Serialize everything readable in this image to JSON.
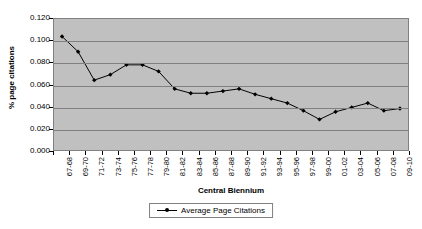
{
  "chart_data": {
    "type": "line",
    "title": "",
    "xlabel": "Central Biennium",
    "ylabel": "% page citations",
    "ylim": [
      0.0,
      0.12
    ],
    "ytick_step": 0.02,
    "grid": true,
    "legend_position": "bottom",
    "yticks": [
      "0.000",
      "0.020",
      "0.040",
      "0.060",
      "0.080",
      "0.100",
      "0.120"
    ],
    "ytick_values": [
      0.0,
      0.02,
      0.04,
      0.06,
      0.08,
      0.1,
      0.12
    ],
    "categories": [
      "67-68",
      "69-70",
      "71-72",
      "73-74",
      "75-76",
      "77-78",
      "79-80",
      "81-82",
      "83-84",
      "85-86",
      "87-88",
      "89-90",
      "91-92",
      "93-94",
      "95-96",
      "97-98",
      "99-00",
      "01-02",
      "03-04",
      "05-06",
      "07-08",
      "09-10"
    ],
    "series": [
      {
        "name": "Average Page Citations",
        "color": "#000000",
        "marker": "diamond",
        "values": [
          0.104,
          0.09,
          0.064,
          0.069,
          0.078,
          0.078,
          0.072,
          0.056,
          0.052,
          0.052,
          0.054,
          0.056,
          0.051,
          0.047,
          0.043,
          0.036,
          0.028,
          0.035,
          0.039,
          0.043,
          0.036,
          0.038
        ]
      }
    ],
    "plot_area_color": "#c0c0c0",
    "gridline_color": "#808080",
    "background_color": "#ffffff"
  },
  "legend": {
    "entries": [
      {
        "label": "Average Page Citations"
      }
    ]
  }
}
